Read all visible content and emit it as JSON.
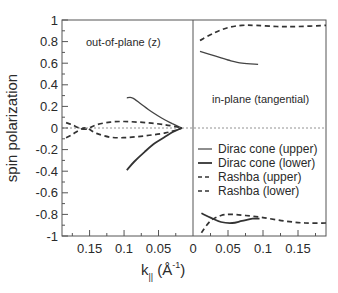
{
  "chart_data": {
    "type": "line",
    "title": "",
    "ylabel": "spin polarization",
    "xlabel": "k||",
    "xlabel_unit": "(Å⁻¹)",
    "xlabel_main": "k",
    "xlabel_sub": "||",
    "xlabel_paren_open": "(",
    "xlabel_angstrom": "Å",
    "xlabel_sup": "-1",
    "xlabel_paren_close": ")",
    "ylim": [
      -1,
      1
    ],
    "yticks": [
      1,
      0.8,
      0.6,
      0.4,
      0.2,
      0,
      -0.2,
      -0.4,
      -0.6,
      -0.8,
      -1
    ],
    "ytick_labels": [
      "1",
      "0.8",
      "0.6",
      "0.4",
      "0.2",
      "0",
      "-0.2",
      "-0.4",
      "-0.6",
      "-0.8",
      "-1"
    ],
    "grid": false,
    "zero_line": "dotted",
    "legend_position": "right-panel-middle",
    "panels": [
      {
        "name": "out-of-plane",
        "annotation": "out-of-plane (z)",
        "x_direction": "reversed",
        "xlim": [
          0,
          0.19
        ],
        "xticks": [
          0.15,
          0.1,
          0.05
        ],
        "xtick_labels": [
          "0.15",
          "0.1",
          "0.05"
        ],
        "series": [
          {
            "name": "Dirac cone (upper)",
            "style": "solid-thin",
            "x": [
              0.096,
              0.088,
              0.075,
              0.06,
              0.045,
              0.03,
              0.02,
              0.016
            ],
            "y": [
              0.28,
              0.28,
              0.22,
              0.15,
              0.09,
              0.04,
              0.01,
              0.0
            ]
          },
          {
            "name": "Dirac cone (lower)",
            "style": "solid",
            "x": [
              0.096,
              0.085,
              0.07,
              0.055,
              0.04,
              0.03,
              0.02,
              0.016
            ],
            "y": [
              -0.39,
              -0.31,
              -0.22,
              -0.14,
              -0.08,
              -0.04,
              -0.01,
              0.0
            ]
          },
          {
            "name": "Rashba (upper)",
            "style": "dashed",
            "x": [
              0.184,
              0.175,
              0.165,
              0.155,
              0.14,
              0.12,
              0.1,
              0.08,
              0.06,
              0.04,
              0.025,
              0.016
            ],
            "y": [
              0.05,
              0.03,
              0.0,
              -0.01,
              0.03,
              0.055,
              0.06,
              0.055,
              0.045,
              0.03,
              0.012,
              0.0
            ]
          },
          {
            "name": "Rashba (lower)",
            "style": "dashed",
            "x": [
              0.184,
              0.175,
              0.165,
              0.155,
              0.14,
              0.12,
              0.1,
              0.08,
              0.06,
              0.04,
              0.025,
              0.016
            ],
            "y": [
              -0.09,
              -0.06,
              -0.02,
              0.0,
              -0.05,
              -0.085,
              -0.09,
              -0.08,
              -0.065,
              -0.045,
              -0.02,
              0.0
            ]
          }
        ]
      },
      {
        "name": "in-plane",
        "annotation": "in-plane (tangential)",
        "x_direction": "normal",
        "xlim": [
          0,
          0.19
        ],
        "xticks": [
          0,
          0.05,
          0.1,
          0.15
        ],
        "xtick_labels": [
          "0",
          "0.05",
          "0.1",
          "0.15"
        ],
        "series": [
          {
            "name": "Dirac cone (upper) +",
            "legend": "Dirac cone (upper)",
            "style": "solid-thin",
            "x": [
              0.01,
              0.03,
              0.05,
              0.07,
              0.093
            ],
            "y": [
              0.71,
              0.67,
              0.63,
              0.6,
              0.59
            ]
          },
          {
            "name": "Dirac cone (lower) -",
            "legend": "Dirac cone (lower)",
            "style": "solid",
            "x": [
              0.012,
              0.025,
              0.04,
              0.056,
              0.07,
              0.085,
              0.095
            ],
            "y": [
              -0.79,
              -0.83,
              -0.87,
              -0.88,
              -0.86,
              -0.84,
              -0.84
            ]
          },
          {
            "name": "Rashba (upper) +",
            "legend": "Rashba (upper)",
            "style": "dashed",
            "x": [
              0.01,
              0.03,
              0.05,
              0.07,
              0.09,
              0.12,
              0.15,
              0.19
            ],
            "y": [
              0.81,
              0.88,
              0.93,
              0.95,
              0.95,
              0.94,
              0.94,
              0.95
            ]
          },
          {
            "name": "Rashba (lower) -",
            "legend": "Rashba (lower)",
            "style": "dashed",
            "x": [
              0.012,
              0.025,
              0.04,
              0.055,
              0.075,
              0.1,
              0.13,
              0.16,
              0.19
            ],
            "y": [
              -0.97,
              -0.86,
              -0.81,
              -0.8,
              -0.81,
              -0.83,
              -0.86,
              -0.88,
              -0.88
            ]
          }
        ]
      }
    ],
    "legend": [
      {
        "label": "Dirac cone (upper)",
        "style": "solid-thin"
      },
      {
        "label": "Dirac cone (lower)",
        "style": "solid"
      },
      {
        "label": "Rashba (upper)",
        "style": "dashed"
      },
      {
        "label": "Rashba (lower)",
        "style": "dashed"
      }
    ],
    "colors": {
      "axis": "#555555",
      "line": "#333333",
      "zero_line": "#777777"
    }
  }
}
